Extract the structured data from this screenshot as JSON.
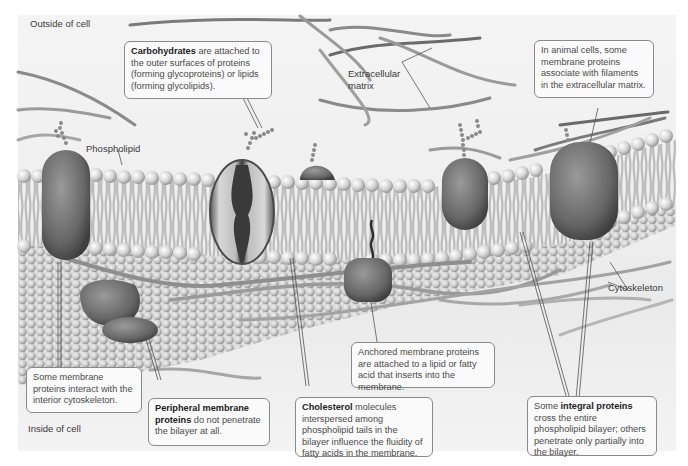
{
  "figure": {
    "region_labels": {
      "outside": "Outside of cell",
      "inside": "Inside of cell"
    },
    "structure_labels": {
      "phospholipid": "Phospholipid",
      "extracellular_matrix_line1": "Extracellular",
      "extracellular_matrix_line2": "matrix",
      "cytoskeleton": "Cytoskeleton"
    },
    "callouts": {
      "carbohydrates": {
        "bold": "Carbohydrates",
        "text": " are attached to the outer surfaces of proteins (forming glycoproteins) or lipids (forming glycolipids)."
      },
      "ecm_association": {
        "text": "In animal cells, some membrane proteins associate with filaments in the extracellular matrix."
      },
      "cytoskeleton_interaction": {
        "text": "Some membrane proteins interact with the interior cytoskeleton."
      },
      "peripheral": {
        "bold": "Peripheral membrane proteins",
        "text": " do not penetrate the bilayer at all."
      },
      "cholesterol": {
        "bold": "Cholesterol",
        "text": " molecules interspersed among phospholipid tails in the bilayer influence the fluidity of fatty acids in the membrane."
      },
      "anchored": {
        "text": "Anchored membrane proteins are attached to a lipid or fatty acid that inserts into the membrane."
      },
      "integral": {
        "pre": "Some ",
        "bold": "integral proteins",
        "text": " cross the entire phospholipid bilayer; others penetrate only partially into the bilayer."
      }
    },
    "colors": {
      "background": "#efefef",
      "protein": "#6e6e6e",
      "lipid_head": "#d9d9d9",
      "filament": "#9a9a9a",
      "callout_border": "#8a8a8a"
    }
  }
}
